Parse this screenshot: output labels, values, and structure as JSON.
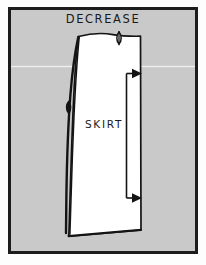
{
  "figure": {
    "title": "DECREASE",
    "piece_label": "SKIRT",
    "colors": {
      "page_background": "#fdfdfd",
      "panel_background": "#c9c9c9",
      "panel_border": "#1c1c1c",
      "pattern_fill": "#ffffff",
      "ink": "#111111",
      "scanline": "#f2f2f2"
    },
    "panel": {
      "x": 8,
      "y": 7,
      "width": 190,
      "height": 247,
      "border_width": 3
    },
    "annotations": {
      "title_position": {
        "x": 103,
        "y": 22
      },
      "piece_label_position": {
        "x": 103,
        "y": 124
      },
      "waist_notch_marker": {
        "x": 119,
        "y": 40,
        "shape": "lens-notch"
      },
      "side_seam_marker": {
        "x": 66,
        "y": 107,
        "shape": "lens-notch"
      },
      "adjustment_arrow_top": {
        "x": 137,
        "y": 73,
        "direction": "right"
      },
      "adjustment_arrow_bottom": {
        "x": 137,
        "y": 198,
        "direction": "right"
      }
    },
    "scanline": {
      "y": 66,
      "height": 1
    }
  }
}
